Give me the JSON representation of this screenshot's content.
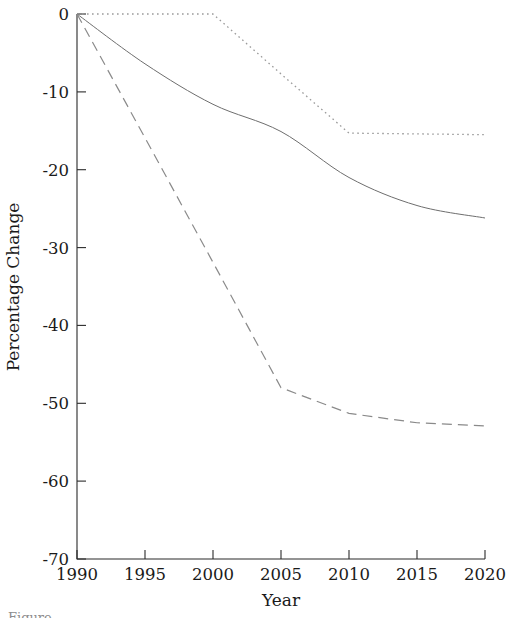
{
  "figure": {
    "background_color": "#ffffff",
    "plot_area": {
      "x0": 77,
      "x1": 485,
      "y0": 14,
      "y1": 559
    }
  },
  "axes": {
    "y_title": "Percentage Change",
    "x_title": "Year",
    "y_ticks": [
      "0",
      "-10",
      "-20",
      "-30",
      "-40",
      "-50",
      "-60",
      "-70"
    ],
    "x_ticks": [
      "1990",
      "1995",
      "2000",
      "2005",
      "2010",
      "2015",
      "2020"
    ]
  },
  "chart_data": {
    "type": "line",
    "title": "",
    "xlabel": "Year",
    "ylabel": "Percentage Change",
    "xlim": [
      1990,
      2020
    ],
    "ylim": [
      -70,
      0
    ],
    "xticks": [
      1990,
      1995,
      2000,
      2005,
      2010,
      2015,
      2020
    ],
    "yticks": [
      0,
      -10,
      -20,
      -30,
      -40,
      -50,
      -60,
      -70
    ],
    "grid": false,
    "legend": "none",
    "x": [
      1990,
      1995,
      2000,
      2005,
      2010,
      2015,
      2020
    ],
    "series": [
      {
        "name": "dotted-series",
        "linestyle": "dotted",
        "color": "#9a9a9a",
        "values": [
          0,
          0,
          0,
          -7.7,
          -15.3,
          -15.4,
          -15.5
        ]
      },
      {
        "name": "solid-series",
        "linestyle": "solid",
        "color": "#6e6e6e",
        "values": [
          0,
          -6.4,
          -11.6,
          -15.1,
          -21.0,
          -24.6,
          -26.2
        ]
      },
      {
        "name": "dashed-series",
        "linestyle": "dashed",
        "color": "#8a8a8a",
        "values": [
          0,
          -15.9,
          -31.9,
          -48.0,
          -51.3,
          -52.5,
          -52.9
        ]
      }
    ]
  },
  "caption": {
    "partial_text": "Figure"
  }
}
